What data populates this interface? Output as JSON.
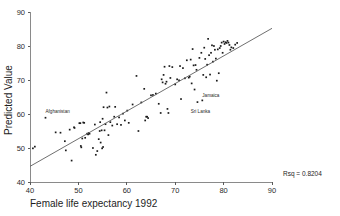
{
  "chart_data": {
    "type": "scatter",
    "title": "",
    "xlabel": "Female life expectancy 1992",
    "ylabel": "Predicted Value",
    "xlim": [
      40,
      90
    ],
    "ylim": [
      40,
      90
    ],
    "xticks": [
      40,
      50,
      60,
      70,
      80,
      90
    ],
    "yticks": [
      40,
      50,
      60,
      70,
      80,
      90
    ],
    "grid": false,
    "legend": null,
    "annotations": [
      {
        "text": "Afghanistan",
        "x": 43.2,
        "y": 60.3
      },
      {
        "text": "Jamaica",
        "x": 75.6,
        "y": 65.0
      },
      {
        "text": "Sri Lanka",
        "x": 73.2,
        "y": 60.2
      },
      {
        "text": "Rsq = 0.8204",
        "x": 93.5,
        "y": 40.5
      }
    ],
    "fit_line": {
      "label": "regression-line",
      "x0": 40.0,
      "y0": 44.6,
      "x1": 90.0,
      "y1": 85.2
    },
    "rsq": 0.8204,
    "points": [
      [
        40.6,
        49.9
      ],
      [
        41.0,
        50.4
      ],
      [
        43.2,
        58.9
      ],
      [
        45.3,
        54.6
      ],
      [
        46.3,
        54.5
      ],
      [
        47.2,
        52.0
      ],
      [
        47.4,
        49.3
      ],
      [
        48.2,
        55.4
      ],
      [
        48.6,
        46.3
      ],
      [
        49.1,
        56.1
      ],
      [
        49.2,
        55.9
      ],
      [
        50.2,
        57.3
      ],
      [
        50.4,
        57.3
      ],
      [
        50.5,
        50.6
      ],
      [
        50.6,
        50.2
      ],
      [
        50.8,
        52.8
      ],
      [
        51.0,
        57.5
      ],
      [
        51.2,
        57.4
      ],
      [
        51.4,
        53.0
      ],
      [
        51.8,
        54.2
      ],
      [
        52.0,
        54.0
      ],
      [
        52.1,
        54.4
      ],
      [
        52.3,
        54.2
      ],
      [
        53.0,
        50.0
      ],
      [
        53.4,
        56.9
      ],
      [
        53.6,
        48.0
      ],
      [
        53.9,
        49.1
      ],
      [
        54.2,
        52.6
      ],
      [
        54.4,
        55.0
      ],
      [
        54.5,
        57.6
      ],
      [
        54.6,
        51.6
      ],
      [
        54.8,
        55.2
      ],
      [
        54.9,
        49.9
      ],
      [
        55.0,
        58.6
      ],
      [
        55.1,
        50.3
      ],
      [
        55.2,
        62.0
      ],
      [
        55.4,
        55.2
      ],
      [
        55.6,
        57.0
      ],
      [
        55.8,
        66.3
      ],
      [
        56.0,
        61.9
      ],
      [
        56.2,
        53.8
      ],
      [
        56.4,
        62.2
      ],
      [
        56.6,
        57.6
      ],
      [
        57.0,
        56.6
      ],
      [
        57.4,
        59.2
      ],
      [
        57.6,
        62.1
      ],
      [
        58.0,
        57.0
      ],
      [
        58.4,
        59.0
      ],
      [
        58.8,
        56.8
      ],
      [
        59.2,
        60.1
      ],
      [
        59.6,
        58.1
      ],
      [
        60.1,
        61.0
      ],
      [
        60.4,
        57.4
      ],
      [
        61.2,
        62.8
      ],
      [
        62.0,
        71.2
      ],
      [
        62.4,
        55.0
      ],
      [
        63.0,
        63.4
      ],
      [
        63.6,
        67.4
      ],
      [
        63.8,
        58.1
      ],
      [
        64.0,
        59.2
      ],
      [
        64.2,
        59.2
      ],
      [
        64.4,
        58.8
      ],
      [
        65.0,
        65.5
      ],
      [
        65.4,
        65.6
      ],
      [
        66.0,
        66.0
      ],
      [
        66.6,
        63.0
      ],
      [
        67.0,
        60.3
      ],
      [
        67.2,
        70.2
      ],
      [
        67.4,
        69.3
      ],
      [
        67.6,
        71.5
      ],
      [
        67.8,
        73.9
      ],
      [
        68.0,
        68.9
      ],
      [
        68.2,
        69.5
      ],
      [
        68.4,
        61.5
      ],
      [
        68.6,
        60.3
      ],
      [
        68.8,
        74.1
      ],
      [
        69.0,
        70.6
      ],
      [
        69.4,
        73.8
      ],
      [
        70.0,
        68.7
      ],
      [
        70.4,
        70.2
      ],
      [
        70.8,
        69.9
      ],
      [
        71.0,
        74.1
      ],
      [
        71.2,
        64.4
      ],
      [
        71.6,
        73.5
      ],
      [
        72.0,
        70.5
      ],
      [
        72.4,
        75.8
      ],
      [
        72.8,
        70.7
      ],
      [
        73.0,
        71.0
      ],
      [
        73.2,
        76.0
      ],
      [
        73.4,
        69.0
      ],
      [
        73.6,
        79.1
      ],
      [
        73.8,
        74.3
      ],
      [
        74.0,
        67.2
      ],
      [
        74.2,
        74.4
      ],
      [
        74.4,
        73.0
      ],
      [
        74.6,
        63.5
      ],
      [
        75.0,
        76.5
      ],
      [
        75.4,
        78.0
      ],
      [
        75.6,
        64.0
      ],
      [
        75.8,
        71.5
      ],
      [
        76.0,
        79.5
      ],
      [
        76.2,
        76.2
      ],
      [
        76.4,
        70.8
      ],
      [
        76.6,
        74.5
      ],
      [
        76.8,
        82.1
      ],
      [
        77.0,
        77.3
      ],
      [
        77.2,
        71.6
      ],
      [
        77.4,
        78.0
      ],
      [
        77.6,
        80.2
      ],
      [
        77.8,
        75.4
      ],
      [
        78.0,
        80.0
      ],
      [
        78.2,
        78.9
      ],
      [
        78.4,
        76.3
      ],
      [
        78.6,
        69.8
      ],
      [
        78.8,
        79.0
      ],
      [
        79.0,
        72.0
      ],
      [
        79.2,
        79.4
      ],
      [
        79.4,
        80.0
      ],
      [
        79.6,
        81.0
      ],
      [
        79.8,
        78.0
      ],
      [
        80.0,
        81.3
      ],
      [
        80.2,
        80.6
      ],
      [
        80.4,
        81.1
      ],
      [
        80.6,
        80.9
      ],
      [
        80.8,
        81.5
      ],
      [
        81.0,
        81.0
      ],
      [
        81.2,
        80.3
      ],
      [
        81.4,
        78.9
      ],
      [
        81.6,
        79.6
      ],
      [
        82.0,
        79.4
      ],
      [
        82.4,
        80.4
      ],
      [
        82.8,
        80.9
      ]
    ]
  },
  "plot_box": {
    "left": 30,
    "top": 12,
    "right": 272,
    "bottom": 182
  }
}
